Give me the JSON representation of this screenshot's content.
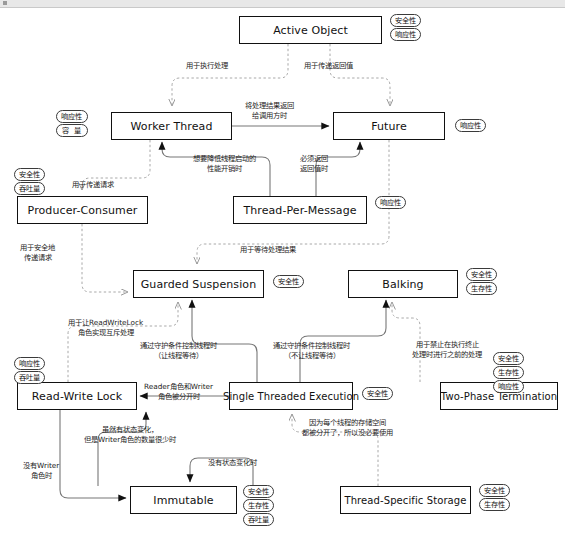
{
  "diagram": {
    "tag_vocabulary": {
      "safety": "安全性",
      "responsiveness": "响应性",
      "liveness": "生存性",
      "throughput": "吞吐量",
      "capacity": "容 量"
    },
    "nodes": [
      {
        "id": "active-object",
        "label": "Active Object",
        "x": 239,
        "y": 16,
        "w": 143,
        "h": 28,
        "tags": [
          "安全性",
          "响应性"
        ],
        "tags_side": "right"
      },
      {
        "id": "worker-thread",
        "label": "Worker Thread",
        "x": 111,
        "y": 112,
        "w": 121,
        "h": 28,
        "tags": [
          "响应性",
          "容 量"
        ],
        "tags_side": "left"
      },
      {
        "id": "future",
        "label": "Future",
        "x": 333,
        "y": 112,
        "w": 112,
        "h": 28,
        "tags": [
          "响应性"
        ],
        "tags_side": "right"
      },
      {
        "id": "producer-consumer",
        "label": "Producer-Consumer",
        "x": 17,
        "y": 196,
        "w": 131,
        "h": 28,
        "tags": [
          "安全性",
          "吞吐量"
        ],
        "tags_side": "left-top"
      },
      {
        "id": "thread-per-message",
        "label": "Thread-Per-Message",
        "x": 233,
        "y": 196,
        "w": 134,
        "h": 28,
        "tags": [
          "响应性"
        ],
        "tags_side": "right"
      },
      {
        "id": "guarded-suspension",
        "label": "Guarded Suspension",
        "x": 133,
        "y": 270,
        "w": 131,
        "h": 28,
        "tags": [
          "安全性"
        ],
        "tags_side": "right"
      },
      {
        "id": "balking",
        "label": "Balking",
        "x": 348,
        "y": 270,
        "w": 110,
        "h": 28,
        "tags": [
          "安全性",
          "生存性"
        ],
        "tags_side": "right"
      },
      {
        "id": "read-write-lock",
        "label": "Read-Write Lock",
        "x": 17,
        "y": 382,
        "w": 120,
        "h": 28,
        "tags": [
          "响应性",
          "吞吐量"
        ],
        "tags_side": "left-top"
      },
      {
        "id": "single-threaded-execution",
        "label": "Single Threaded Execution",
        "x": 229,
        "y": 382,
        "w": 124,
        "h": 28,
        "tags": [
          "安全性"
        ],
        "tags_side": "right"
      },
      {
        "id": "two-phase-termination",
        "label": "Two-Phase Termination",
        "x": 440,
        "y": 382,
        "w": 118,
        "h": 28,
        "tags": [
          "安全性",
          "生存性",
          "响应性"
        ],
        "tags_side": "right-top"
      },
      {
        "id": "immutable",
        "label": "Immutable",
        "x": 130,
        "y": 486,
        "w": 107,
        "h": 28,
        "tags": [
          "安全性",
          "生存性",
          "吞吐量"
        ],
        "tags_side": "right"
      },
      {
        "id": "thread-specific-storage",
        "label": "Thread-Specific Storage",
        "x": 340,
        "y": 486,
        "w": 131,
        "h": 28,
        "tags": [
          "安全性",
          "生存性"
        ],
        "tags_side": "right"
      }
    ],
    "edge_labels": [
      {
        "id": "l-exec",
        "text": "用于执行处理",
        "x": 186,
        "y": 61
      },
      {
        "id": "l-return-value",
        "text": "用于传递返回值",
        "x": 304,
        "y": 61
      },
      {
        "id": "l-result-back",
        "text": "将处理结果返回\n给调用方时",
        "x": 245,
        "y": 101
      },
      {
        "id": "l-reduce-cost",
        "text": "想要降低线程启动的\n性能开销时",
        "x": 193,
        "y": 154
      },
      {
        "id": "l-must-return",
        "text": "必须返回\n返回值时",
        "x": 300,
        "y": 154
      },
      {
        "id": "l-pass-request",
        "text": "用于传递请求",
        "x": 72,
        "y": 180
      },
      {
        "id": "l-safe-pass",
        "text": "用于安全地\n传递请求",
        "x": 20,
        "y": 243
      },
      {
        "id": "l-wait-result",
        "text": "用于等待处理结果",
        "x": 240,
        "y": 245
      },
      {
        "id": "l-rwlock-mutex",
        "text": "用于让ReadWriteLock\n角色实现互斥处理",
        "x": 68,
        "y": 318
      },
      {
        "id": "l-guard-wait",
        "text": "通过守护条件控制线程时\n（让线程等待）",
        "x": 140,
        "y": 341
      },
      {
        "id": "l-guard-nowait",
        "text": "通过守护条件控制线程时\n（不让线程等待）",
        "x": 273,
        "y": 341
      },
      {
        "id": "l-prohibit",
        "text": "用于禁止在执行终止\n处理时进行之前的处理",
        "x": 412,
        "y": 340
      },
      {
        "id": "l-reader-writer",
        "text": "Reader角色和Writer\n角色被分开时",
        "x": 144,
        "y": 382
      },
      {
        "id": "l-state-change",
        "text": "虽然有状态变化，\n但是Writer角色的数量很少时",
        "x": 84,
        "y": 425
      },
      {
        "id": "l-no-state",
        "text": "没有状态变化时",
        "x": 208,
        "y": 458
      },
      {
        "id": "l-no-writer",
        "text": "没有Writer\n角色时",
        "x": 23,
        "y": 461
      },
      {
        "id": "l-per-thread",
        "text": "因为每个线程的存储空间\n都被分开了，所以没必要使用",
        "x": 302,
        "y": 418
      }
    ]
  }
}
